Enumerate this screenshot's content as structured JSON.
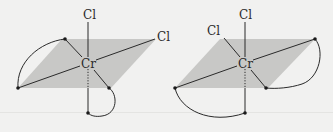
{
  "figure": {
    "colors": {
      "plane": "#c8c8c6",
      "line": "#2a2a2a",
      "background": "#f1f1f0"
    },
    "isomers": [
      {
        "metal": "Cr",
        "ligands": [
          "Cl",
          "Cl"
        ],
        "cr": [
          88,
          63
        ],
        "cl_top": [
          88,
          17
        ],
        "cl_side": [
          160,
          38
        ],
        "dots": [
          [
            65,
            39
          ],
          [
            18,
            88
          ],
          [
            109,
            88
          ],
          [
            88,
            113
          ]
        ],
        "plane": [
          [
            18,
            88
          ],
          [
            62,
            39
          ],
          [
            156,
            39
          ],
          [
            111,
            88
          ]
        ]
      },
      {
        "metal": "Cr",
        "ligands": [
          "Cl",
          "Cl"
        ],
        "cr": [
          245,
          63
        ],
        "cl_top": [
          245,
          17
        ],
        "cl_side": [
          216,
          34
        ],
        "dots": [
          [
            315,
            39
          ],
          [
            175,
            88
          ],
          [
            266,
            88
          ],
          [
            245,
            113
          ]
        ],
        "plane": [
          [
            175,
            88
          ],
          [
            220,
            39
          ],
          [
            315,
            39
          ],
          [
            268,
            88
          ]
        ]
      }
    ],
    "labels": {
      "left_top_cl": "Cl",
      "left_side_cl": "Cl",
      "left_metal": "Cr",
      "right_top_cl": "Cl",
      "right_side_cl": "Cl",
      "right_metal": "Cr"
    }
  }
}
